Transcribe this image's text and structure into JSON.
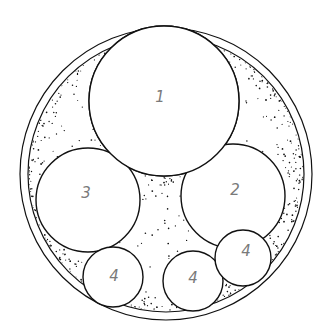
{
  "diagram": {
    "type": "cross-section",
    "compartments": [
      {
        "id": "c1",
        "label": "1"
      },
      {
        "id": "c2",
        "label": "2"
      },
      {
        "id": "c3",
        "label": "3"
      },
      {
        "id": "c4a",
        "label": "4"
      },
      {
        "id": "c4b",
        "label": "4"
      },
      {
        "id": "c4c",
        "label": "4"
      }
    ],
    "colors": {
      "line": "#111111",
      "label": "#7a7a7a",
      "background": "#ffffff",
      "stipple": "#111111"
    }
  }
}
